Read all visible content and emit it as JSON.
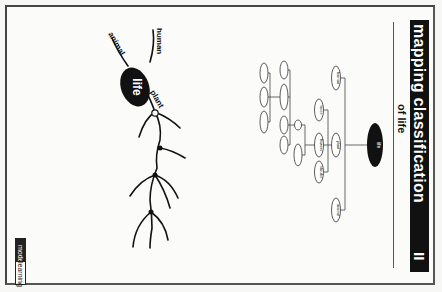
{
  "header": {
    "title": "mapping classification",
    "subtitle": "of life",
    "part": "II"
  },
  "concept_map": {
    "root": "life",
    "level1": [
      "human",
      "plant",
      "animal"
    ],
    "plant_children": [
      "trees",
      "flowers",
      "shrubs"
    ],
    "level3": [
      "oak",
      "rose",
      "daisy",
      "tulip",
      "grass",
      "lily",
      "ivy",
      "fern",
      "moss",
      "cactus"
    ]
  },
  "sketch": {
    "center_label": "life",
    "branch_labels": [
      "animal",
      "human",
      "plant"
    ]
  },
  "logo": {
    "brand1": "model",
    "brand2": "learning"
  },
  "colors": {
    "header_bg": "#111111",
    "root_node": "#111111",
    "line": "#444444"
  }
}
